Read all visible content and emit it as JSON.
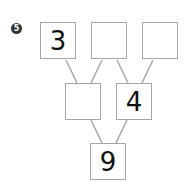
{
  "problem": {
    "number": "5",
    "tree": {
      "top_row": [
        {
          "value": "3"
        },
        {
          "value": ""
        },
        {
          "value": ""
        }
      ],
      "middle_row": [
        {
          "value": ""
        },
        {
          "value": "4"
        }
      ],
      "bottom_row": [
        {
          "value": "9"
        }
      ]
    }
  },
  "colors": {
    "line": "#a6a6a6",
    "box_border": "#a6a6a6",
    "badge": "#333333"
  }
}
